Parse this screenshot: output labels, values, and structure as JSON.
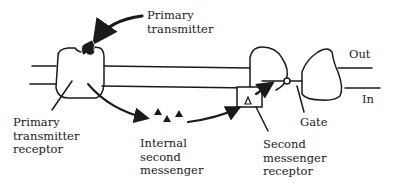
{
  "diagram": {
    "labels": {
      "primary_transmitter": [
        "Primary",
        "transmitter"
      ],
      "primary_transmitter_receptor": [
        "Primary",
        "transmitter",
        "receptor"
      ],
      "internal_second_messenger": [
        "Internal",
        "second",
        "messenger"
      ],
      "second_messenger_receptor": [
        "Second",
        "messenger",
        "receptor"
      ],
      "gate": "Gate",
      "out": "Out",
      "in": "In"
    },
    "colors": {
      "ink": "#1a1a1a",
      "background": "#ffffff"
    }
  }
}
